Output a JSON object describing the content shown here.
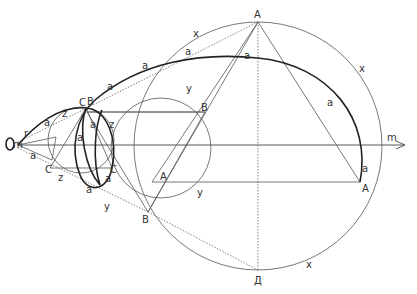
{
  "diagram": {
    "axis": {
      "label": "m"
    },
    "circles": [
      {
        "id": "circle-x",
        "label": "x"
      },
      {
        "id": "circle-y",
        "label": "y"
      },
      {
        "id": "circle-z",
        "label": "z"
      },
      {
        "id": "circle-r",
        "label": "r"
      }
    ],
    "spiral": {
      "label": "a"
    },
    "vertices": {
      "A": "A",
      "B": "В",
      "C": "С",
      "D": "Д"
    },
    "labels": [
      {
        "text": "A",
        "role": "vertex-A-top"
      },
      {
        "text": "A",
        "role": "vertex-A-right"
      },
      {
        "text": "A",
        "role": "vertex-A-left"
      },
      {
        "text": "В",
        "role": "vertex-B-right"
      },
      {
        "text": "В",
        "role": "vertex-B-bottom"
      },
      {
        "text": "В",
        "role": "vertex-B-top"
      },
      {
        "text": "С",
        "role": "vertex-C-top"
      },
      {
        "text": "С",
        "role": "vertex-C-left"
      },
      {
        "text": "С",
        "role": "vertex-C-right"
      },
      {
        "text": "Д",
        "role": "vertex-D"
      },
      {
        "text": "x",
        "role": "circle-x-label-upper-left"
      },
      {
        "text": "x",
        "role": "circle-x-label-upper-right"
      },
      {
        "text": "x",
        "role": "circle-x-label-lower"
      },
      {
        "text": "y",
        "role": "circle-y-label-top"
      },
      {
        "text": "y",
        "role": "circle-y-label-right"
      },
      {
        "text": "y",
        "role": "circle-y-label-lower"
      },
      {
        "text": "z",
        "role": "circle-z-label-top"
      },
      {
        "text": "z",
        "role": "circle-z-label-right"
      },
      {
        "text": "z",
        "role": "circle-z-label-bottom"
      },
      {
        "text": "r",
        "role": "circle-r-label"
      },
      {
        "text": "m",
        "role": "axis-label-right"
      },
      {
        "text": "m",
        "role": "axis-label-left"
      },
      {
        "text": "a",
        "role": "spiral-label"
      }
    ]
  }
}
